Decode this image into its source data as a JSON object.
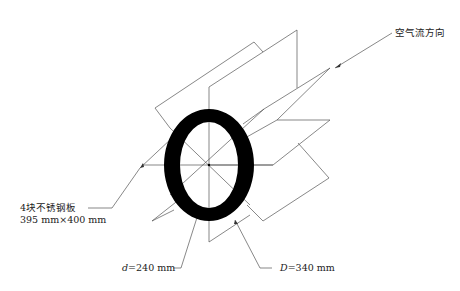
{
  "diagram": {
    "type": "technical-drawing",
    "labels": {
      "airflow": "空气流方向",
      "plates_line1": "4块不锈钢板",
      "plates_line2": "395 mm×400 mm",
      "inner_var": "d",
      "inner_value": "=240 mm",
      "outer_var": "D",
      "outer_value": "=340 mm"
    },
    "ring": {
      "center": [
        209,
        165
      ],
      "outer_radii": [
        45,
        56
      ],
      "inner_radii": [
        29,
        43
      ],
      "color": "#000000"
    },
    "line_color": "#555555"
  }
}
